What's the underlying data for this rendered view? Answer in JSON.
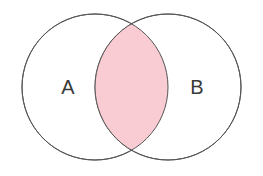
{
  "diagram": {
    "type": "venn-two-set",
    "canvas": {
      "width": 263,
      "height": 176,
      "background_color": "#ffffff"
    },
    "style": {
      "stroke_color": "#555555",
      "stroke_width": 1,
      "circle_fill": "#ffffff",
      "intersection_fill": "#f8ccd2",
      "label_color": "#3a3a3a"
    },
    "sets": [
      {
        "id": "set-a",
        "label": "A",
        "center_x": 95,
        "center_y": 87,
        "radius": 73,
        "label_x": 68,
        "label_y": 88
      },
      {
        "id": "set-b",
        "label": "B",
        "center_x": 168,
        "center_y": 87,
        "radius": 73,
        "label_x": 197,
        "label_y": 88
      }
    ],
    "intersection": {
      "id": "intersection-ab",
      "label": "",
      "fill_color": "#f8ccd2",
      "shaded": true,
      "top_point_x": 131.5,
      "top_point_y": 23.5,
      "bottom_point_x": 131.5,
      "bottom_point_y": 150.5,
      "left_extent_x": 95,
      "right_extent_x": 168
    }
  }
}
